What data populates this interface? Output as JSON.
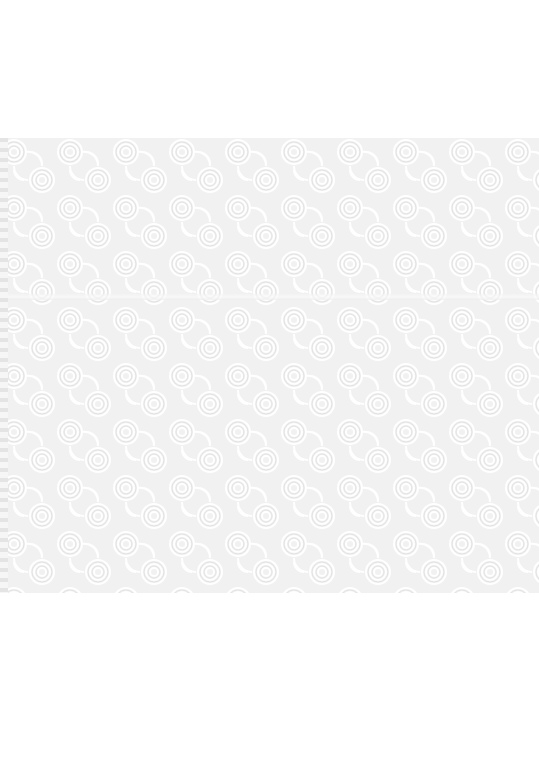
{
  "scene": {
    "subject": "embossed white paper towel sheet",
    "pattern": "swirling concentric-arc emboss pattern",
    "background_color": "#ffffff",
    "sheet_color": "#f3f3f3",
    "pattern_color": "#ffffff",
    "shadow_color": "#d9d9d9"
  }
}
